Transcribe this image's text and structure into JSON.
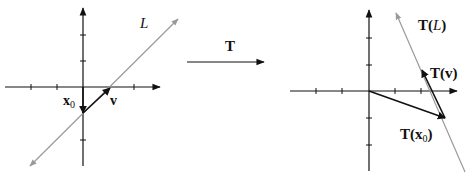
{
  "diagram": {
    "left_panel": {
      "line_label": "L",
      "x0_label": "x",
      "x0_sub": "0",
      "v_label": "v"
    },
    "transform": {
      "label": "T"
    },
    "right_panel": {
      "line_label_main": "T(",
      "line_label_var": "L",
      "line_label_close": ")",
      "tv_label": "T(v)",
      "tx0_label_main": "T(x",
      "tx0_sub": "0",
      "tx0_close": ")"
    },
    "colors": {
      "axis": "#111111",
      "line": "#9a9a9a",
      "vector": "#111111"
    }
  }
}
